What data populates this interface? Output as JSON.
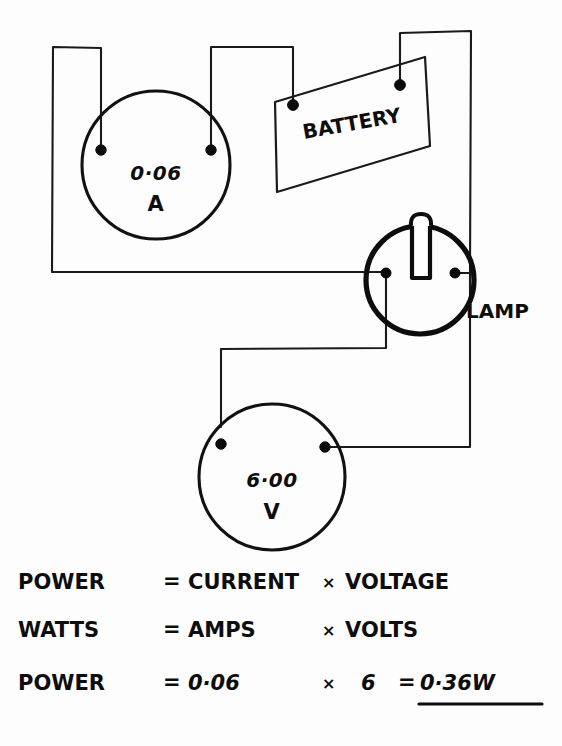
{
  "document": {
    "title": "Electrical Power Circuit Worksheet",
    "background_color": "#fdfdfd",
    "ink_color": "#0d0d0d"
  },
  "circuit": {
    "ammeter": {
      "name": "Ammeter",
      "value": "0·06",
      "unit": "A",
      "terminal_count": 2
    },
    "voltmeter": {
      "name": "Voltmeter",
      "value": "6·00",
      "unit": "V",
      "terminal_count": 2
    },
    "battery": {
      "name": "Battery",
      "label": "BATTERY",
      "terminal_count": 2
    },
    "lamp": {
      "name": "Lamp",
      "label": "LAMP",
      "terminal_count": 2
    }
  },
  "equations": [
    {
      "id": "formula-words",
      "left": "POWER",
      "equals": "=",
      "operand_a": "CURRENT",
      "times": "×",
      "operand_b": "VOLTAGE"
    },
    {
      "id": "formula-units",
      "left": "WATTS",
      "equals": "=",
      "operand_a": "AMPS",
      "times": "×",
      "operand_b": "VOLTS"
    },
    {
      "id": "formula-numbers",
      "left": "POWER",
      "equals": "=",
      "operand_a": "0·06",
      "times": "×",
      "operand_b": "6",
      "result_equals": "=",
      "result": "0·36W"
    }
  ]
}
